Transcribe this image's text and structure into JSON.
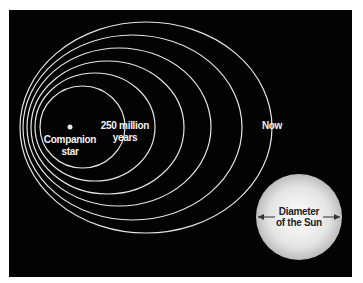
{
  "diagram": {
    "colors": {
      "background": "#030303",
      "orbit_stroke": "#e6e6e6",
      "label_light": "#f2f2f2",
      "label_dark": "#222222",
      "sun_center": "#ffffff",
      "sun_edge": "#c4c4c4"
    },
    "labels": {
      "companion_line1": "Companion",
      "companion_line2": "star",
      "orbit_inner_line1": "250 million",
      "orbit_inner_line2": "years",
      "orbit_outer": "Now",
      "sun_line1": "Diameter",
      "sun_line2": "of the Sun"
    },
    "companion_star": {
      "cx": 70,
      "cy": 127,
      "r": 2.5
    },
    "orbits": [
      {
        "name": "orbit-1-250-million-years",
        "left": 40,
        "right": 125,
        "top": 86,
        "bottom": 168
      },
      {
        "name": "orbit-2",
        "left": 35,
        "right": 155,
        "top": 73,
        "bottom": 181
      },
      {
        "name": "orbit-3",
        "left": 31,
        "right": 184,
        "top": 61,
        "bottom": 194
      },
      {
        "name": "orbit-4",
        "left": 27,
        "right": 211,
        "top": 48,
        "bottom": 206
      },
      {
        "name": "orbit-5",
        "left": 23,
        "right": 242,
        "top": 35,
        "bottom": 220
      },
      {
        "name": "orbit-6-now",
        "left": 20,
        "right": 272,
        "top": 22,
        "bottom": 233
      }
    ],
    "sun": {
      "cx": 299,
      "cy": 217,
      "r": 43
    }
  }
}
